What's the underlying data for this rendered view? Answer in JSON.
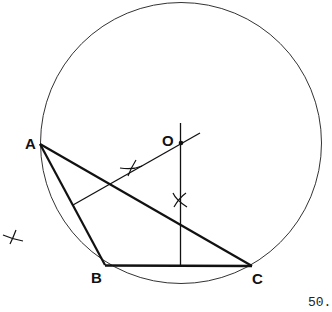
{
  "diagram": {
    "points": {
      "A": {
        "label": "A",
        "x": 40,
        "y": 144
      },
      "B": {
        "label": "B",
        "x": 105,
        "y": 265
      },
      "C": {
        "label": "C",
        "x": 252,
        "y": 266
      },
      "O": {
        "label": "O",
        "x": 181,
        "y": 143
      }
    },
    "circle": {
      "cx": 181,
      "cy": 143,
      "r": 141
    },
    "segments": [
      "AB",
      "BC",
      "CA"
    ],
    "constructions": [
      "perpendicular bisector of AB through O",
      "perpendicular bisector of BC through O"
    ],
    "arc_marks": 3
  },
  "page_number": "50."
}
